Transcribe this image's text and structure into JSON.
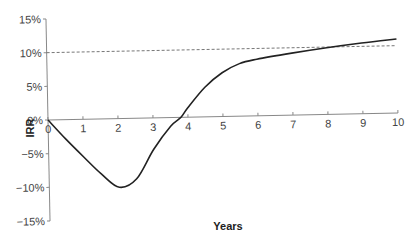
{
  "chart_data": {
    "type": "line",
    "title": "",
    "xlabel": "Years",
    "ylabel": "IRR",
    "xlim": [
      0,
      10
    ],
    "ylim": [
      -15,
      15
    ],
    "x_ticks": [
      "0",
      "1",
      "2",
      "3",
      "4",
      "5",
      "6",
      "7",
      "8",
      "9",
      "10"
    ],
    "y_ticks": [
      "15%",
      "10%",
      "5%",
      "0%",
      "-5%",
      "-10%",
      "-15%"
    ],
    "y_tick_values": [
      15,
      10,
      5,
      0,
      -5,
      -10,
      -15
    ],
    "grid": false,
    "legend": null,
    "series": [
      {
        "name": "IRR",
        "style": "solid",
        "x": [
          0,
          0.5,
          1,
          1.5,
          2,
          2.5,
          3,
          3.5,
          3.8,
          4,
          4.5,
          5,
          5.5,
          6,
          7,
          8,
          9,
          10
        ],
        "values": [
          0,
          -2.9,
          -5.6,
          -8.2,
          -10.2,
          -9.0,
          -4.7,
          -1.3,
          0,
          1.4,
          4.4,
          6.5,
          7.8,
          8.4,
          9.2,
          9.9,
          10.5,
          11.0
        ]
      },
      {
        "name": "Reference 10%",
        "style": "dashed",
        "x": [
          0,
          10
        ],
        "values": [
          10,
          10
        ]
      }
    ]
  },
  "colors": {
    "line": "#222222",
    "axis": "#888888",
    "dashed": "#555555"
  }
}
